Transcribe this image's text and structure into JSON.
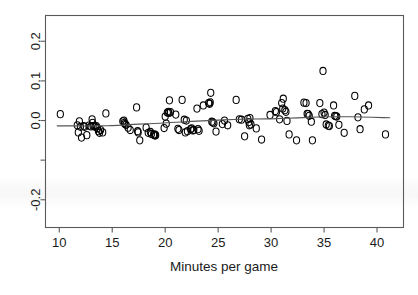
{
  "chart_data": {
    "type": "scatter",
    "title": "",
    "subtitle": "",
    "xlabel": "Minutes per game",
    "ylabel": "",
    "xlim": [
      8.7,
      42.5
    ],
    "ylim": [
      -0.27,
      0.265
    ],
    "grid": false,
    "legend": null,
    "xticks": [
      10,
      15,
      20,
      25,
      30,
      35,
      40
    ],
    "xtick_labels": [
      "10",
      "15",
      "20",
      "25",
      "30",
      "35",
      "40"
    ],
    "yticks": [
      0.2,
      0.1,
      0.0,
      -0.1,
      -0.2
    ],
    "ytick_labels": [
      "0.2",
      "0.1",
      "0.0",
      "",
      "-0.2"
    ],
    "marker": "open-circle",
    "marker_color": "#000000",
    "n_points": 122,
    "points": [
      [
        10.1,
        0.016
      ],
      [
        11.7,
        -0.012
      ],
      [
        11.8,
        -0.03
      ],
      [
        11.9,
        -0.002
      ],
      [
        12.0,
        -0.016
      ],
      [
        12.1,
        -0.043
      ],
      [
        12.3,
        -0.014
      ],
      [
        12.4,
        -0.016
      ],
      [
        12.6,
        -0.037
      ],
      [
        12.8,
        -0.013
      ],
      [
        13.0,
        -0.015
      ],
      [
        13.1,
        0.003
      ],
      [
        13.15,
        -0.006
      ],
      [
        13.2,
        -0.014
      ],
      [
        13.4,
        -0.016
      ],
      [
        13.5,
        -0.014
      ],
      [
        13.6,
        -0.019
      ],
      [
        13.7,
        -0.027
      ],
      [
        13.8,
        -0.031
      ],
      [
        13.9,
        -0.024
      ],
      [
        14.1,
        -0.03
      ],
      [
        14.4,
        0.018
      ],
      [
        16.0,
        -0.002
      ],
      [
        16.1,
        0.0
      ],
      [
        16.15,
        -0.006
      ],
      [
        16.2,
        -0.009
      ],
      [
        16.3,
        -0.011
      ],
      [
        16.5,
        -0.018
      ],
      [
        16.7,
        -0.024
      ],
      [
        17.3,
        0.033
      ],
      [
        17.4,
        -0.027
      ],
      [
        17.45,
        -0.03
      ],
      [
        17.6,
        -0.05
      ],
      [
        18.2,
        -0.018
      ],
      [
        18.4,
        -0.031
      ],
      [
        18.6,
        -0.029
      ],
      [
        18.7,
        -0.034
      ],
      [
        18.9,
        -0.036
      ],
      [
        19.0,
        -0.035
      ],
      [
        19.05,
        -0.038
      ],
      [
        19.1,
        -0.037
      ],
      [
        19.9,
        -0.019
      ],
      [
        20.0,
        0.01
      ],
      [
        20.1,
        -0.008
      ],
      [
        20.2,
        0.02
      ],
      [
        20.3,
        0.022
      ],
      [
        20.35,
        0.019
      ],
      [
        20.4,
        0.051
      ],
      [
        20.5,
        0.021
      ],
      [
        21.0,
        0.015
      ],
      [
        21.2,
        -0.021
      ],
      [
        21.3,
        -0.024
      ],
      [
        21.6,
        0.052
      ],
      [
        21.8,
        0.002
      ],
      [
        21.9,
        -0.03
      ],
      [
        22.0,
        0.0
      ],
      [
        22.1,
        -0.027
      ],
      [
        22.4,
        -0.022
      ],
      [
        22.5,
        -0.02
      ],
      [
        22.6,
        -0.025
      ],
      [
        22.7,
        -0.024
      ],
      [
        23.0,
        0.03
      ],
      [
        23.1,
        -0.022
      ],
      [
        23.2,
        -0.026
      ],
      [
        23.6,
        0.038
      ],
      [
        24.1,
        0.044
      ],
      [
        24.2,
        0.042
      ],
      [
        24.25,
        0.046
      ],
      [
        24.3,
        0.07
      ],
      [
        24.4,
        -0.003
      ],
      [
        24.5,
        -0.005
      ],
      [
        24.6,
        -0.007
      ],
      [
        24.8,
        -0.028
      ],
      [
        25.4,
        -0.009
      ],
      [
        25.6,
        0.0
      ],
      [
        25.9,
        -0.012
      ],
      [
        26.7,
        0.052
      ],
      [
        27.0,
        0.003
      ],
      [
        27.2,
        0.002
      ],
      [
        27.5,
        -0.04
      ],
      [
        27.8,
        0.004
      ],
      [
        27.9,
        -0.004
      ],
      [
        27.95,
        -0.012
      ],
      [
        28.0,
        0.006
      ],
      [
        28.1,
        -0.01
      ],
      [
        28.6,
        -0.02
      ],
      [
        29.1,
        -0.048
      ],
      [
        29.9,
        0.014
      ],
      [
        30.4,
        0.024
      ],
      [
        30.5,
        0.021
      ],
      [
        30.8,
        0.003
      ],
      [
        31.0,
        0.044
      ],
      [
        31.1,
        0.03
      ],
      [
        31.15,
        0.055
      ],
      [
        31.3,
        0.026
      ],
      [
        31.4,
        0.022
      ],
      [
        31.5,
        -0.001
      ],
      [
        31.7,
        -0.035
      ],
      [
        32.4,
        -0.05
      ],
      [
        33.1,
        0.045
      ],
      [
        33.3,
        0.044
      ],
      [
        33.4,
        0.017
      ],
      [
        33.5,
        0.016
      ],
      [
        33.6,
        0.012
      ],
      [
        33.8,
        -0.003
      ],
      [
        33.9,
        -0.05
      ],
      [
        34.6,
        0.044
      ],
      [
        34.8,
        0.016
      ],
      [
        34.9,
        0.125
      ],
      [
        35.0,
        0.02
      ],
      [
        35.1,
        0.014
      ],
      [
        35.2,
        -0.01
      ],
      [
        35.4,
        -0.013
      ],
      [
        35.5,
        -0.014
      ],
      [
        35.9,
        0.038
      ],
      [
        36.0,
        0.012
      ],
      [
        36.1,
        0.011
      ],
      [
        36.2,
        0.01
      ],
      [
        36.4,
        -0.011
      ],
      [
        36.9,
        -0.031
      ],
      [
        37.9,
        0.062
      ],
      [
        38.2,
        0.008
      ],
      [
        38.4,
        -0.022
      ],
      [
        38.8,
        0.028
      ],
      [
        39.2,
        0.038
      ],
      [
        40.8,
        -0.035
      ]
    ],
    "trend": {
      "type": "lowess-smoother",
      "color": "#555555",
      "points": [
        [
          9.8,
          -0.0135
        ],
        [
          11.0,
          -0.0136
        ],
        [
          12.0,
          -0.0137
        ],
        [
          13.0,
          -0.0137
        ],
        [
          14.0,
          -0.0136
        ],
        [
          15.0,
          -0.013
        ],
        [
          16.0,
          -0.0114
        ],
        [
          17.0,
          -0.0097
        ],
        [
          18.0,
          -0.0085
        ],
        [
          19.0,
          -0.0075
        ],
        [
          20.0,
          -0.006
        ],
        [
          21.0,
          -0.0044
        ],
        [
          22.0,
          -0.0028
        ],
        [
          23.0,
          -0.0014
        ],
        [
          24.0,
          -0.0002
        ],
        [
          25.0,
          0.001
        ],
        [
          26.0,
          0.0022
        ],
        [
          27.0,
          0.0032
        ],
        [
          28.0,
          0.0036
        ],
        [
          29.0,
          0.0038
        ],
        [
          30.0,
          0.0043
        ],
        [
          31.0,
          0.0052
        ],
        [
          32.0,
          0.0062
        ],
        [
          33.0,
          0.0073
        ],
        [
          34.0,
          0.0083
        ],
        [
          35.0,
          0.0091
        ],
        [
          36.0,
          0.0096
        ],
        [
          37.0,
          0.0096
        ],
        [
          38.0,
          0.0092
        ],
        [
          39.0,
          0.0086
        ],
        [
          40.0,
          0.0078
        ],
        [
          41.2,
          0.0068
        ]
      ]
    }
  }
}
